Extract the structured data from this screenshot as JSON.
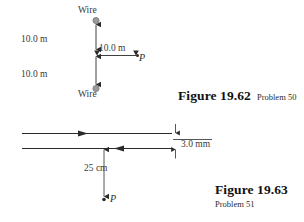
{
  "page": {
    "background_color": "#ffffff",
    "ink_color": "#2b2b2b",
    "dot_color": "#808080"
  },
  "figures": [
    {
      "id": "fig-19-62",
      "caption_title": "Figure 19.62",
      "caption_subtitle": "Problem 50",
      "description": "Two parallel wires seen end-on, separated vertically, with point P located to the right of the midpoint",
      "labels": {
        "wire_top": "Wire",
        "wire_bottom": "Wire",
        "distance_upper": "10.0 m",
        "distance_lower": "10.0 m",
        "distance_horizontal": "10.0 m",
        "point": "P"
      }
    },
    {
      "id": "fig-19-63",
      "caption_title": "Figure 19.63",
      "caption_subtitle": "Problem 51",
      "description": "Two long parallel wires carrying currents in opposite directions, separated by 3.0 mm, with point P 25 cm below",
      "labels": {
        "gap": "3.0 mm",
        "distance_to_point": "25 cm",
        "point": "P"
      }
    }
  ]
}
